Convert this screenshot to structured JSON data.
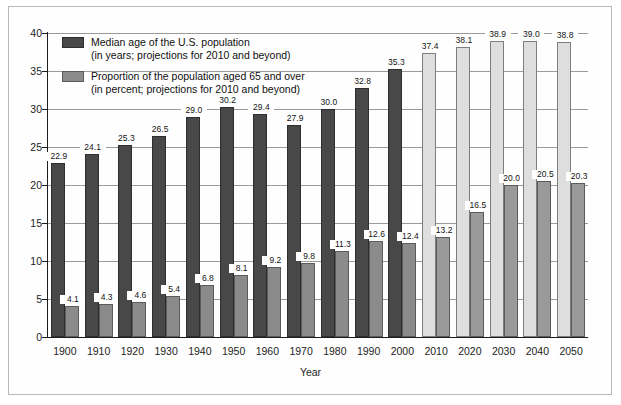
{
  "chart_data": {
    "type": "bar",
    "title": "",
    "xlabel": "Year",
    "ylabel": "",
    "ylim": [
      0,
      40
    ],
    "yticks": [
      0,
      5,
      10,
      15,
      20,
      25,
      30,
      35,
      40
    ],
    "grid": true,
    "legend_position": "inside-top-left",
    "categories": [
      "1900",
      "1910",
      "1920",
      "1930",
      "1940",
      "1950",
      "1960",
      "1970",
      "1980",
      "1990",
      "2000",
      "2010",
      "2020",
      "2030",
      "2040",
      "2050"
    ],
    "projection_start": "2010",
    "series": [
      {
        "name": "Median age of the U.S. population",
        "unit": "years",
        "note": "projections for 2010 and beyond",
        "values": [
          22.9,
          24.1,
          25.3,
          26.5,
          29.0,
          30.2,
          29.4,
          27.9,
          30.0,
          32.8,
          35.3,
          37.4,
          38.1,
          38.9,
          39.0,
          38.8
        ],
        "color": "#484848",
        "projection_color": "#dedede"
      },
      {
        "name": "Proportion of the population aged 65 and over",
        "unit": "percent",
        "note": "projections for 2010 and beyond",
        "values": [
          4.1,
          4.3,
          4.6,
          5.4,
          6.8,
          8.1,
          9.2,
          9.8,
          11.3,
          12.6,
          12.4,
          13.2,
          16.5,
          20.0,
          20.5,
          20.3
        ],
        "color": "#8b8b8b",
        "projection_color": "#9a9a9a"
      }
    ]
  },
  "legend": {
    "items": [
      {
        "line1": "Median age of the U.S. population",
        "line2": "(in years; projections for 2010 and beyond)",
        "swatch": "dark"
      },
      {
        "line1": "Proportion of the population aged 65 and over",
        "line2": "(in percent; projections for 2010 and beyond)",
        "swatch": "mid"
      }
    ]
  },
  "axes": {
    "x_title": "Year"
  }
}
